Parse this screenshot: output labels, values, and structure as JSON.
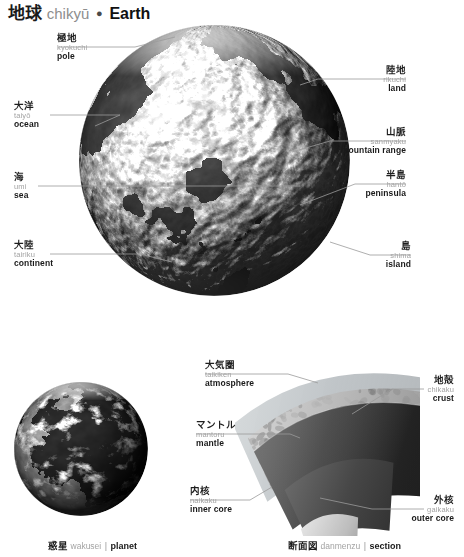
{
  "title": {
    "jp": "地球",
    "romaji": "chikyū",
    "separator": "●",
    "en": "Earth"
  },
  "main_figure": {
    "name": "earth-globe-relief",
    "description": "grayscale shaded-relief globe of Earth centred on Africa / Europe"
  },
  "labels": [
    {
      "id": "pole",
      "jp": "極地",
      "romaji": "kyokuchi",
      "en": "pole"
    },
    {
      "id": "land",
      "jp": "陸地",
      "romaji": "rikuchi",
      "en": "land"
    },
    {
      "id": "ocean",
      "jp": "大洋",
      "romaji": "taiyō",
      "en": "ocean"
    },
    {
      "id": "mountain-range",
      "jp": "山脈",
      "romaji": "sanmyaku",
      "en": "mountain range"
    },
    {
      "id": "sea",
      "jp": "海",
      "romaji": "umi",
      "en": "sea"
    },
    {
      "id": "peninsula",
      "jp": "半島",
      "romaji": "hantō",
      "en": "peninsula"
    },
    {
      "id": "continent",
      "jp": "大陸",
      "romaji": "tairiku",
      "en": "continent"
    },
    {
      "id": "island",
      "jp": "島",
      "romaji": "shima",
      "en": "island"
    },
    {
      "id": "atmosphere",
      "jp": "大気圏",
      "romaji": "taikiken",
      "en": "atmosphere"
    },
    {
      "id": "crust",
      "jp": "地殻",
      "romaji": "chikaku",
      "en": "crust"
    },
    {
      "id": "mantle",
      "jp": "マントル",
      "romaji": "mantoru",
      "en": "mantle"
    },
    {
      "id": "inner-core",
      "jp": "内核",
      "romaji": "naikaku",
      "en": "inner core"
    },
    {
      "id": "outer-core",
      "jp": "外核",
      "romaji": "gaikaku",
      "en": "outer core"
    }
  ],
  "captions": [
    {
      "id": "planet",
      "jp": "惑星",
      "romaji": "wakusei",
      "bar": "|",
      "en": "planet"
    },
    {
      "id": "section",
      "jp": "断面図",
      "romaji": "danmenzu",
      "bar": "|",
      "en": "section"
    }
  ],
  "colors": {
    "jp_text": "#1e1e1e",
    "romaji_text": "#a3a3a3",
    "en_text": "#1a1a1a",
    "leader_line": "#9b9b9b",
    "background": "#ffffff"
  }
}
